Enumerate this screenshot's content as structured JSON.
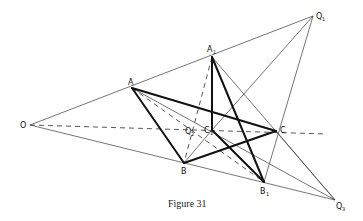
{
  "figure": {
    "caption": "Figure 31",
    "colors": {
      "background": "#ffffff",
      "ink": "#111111",
      "thin_ink": "#3a3a3a"
    },
    "points": {
      "O": {
        "label": "O",
        "sub": "",
        "x": 30,
        "y": 125
      },
      "A": {
        "label": "A",
        "sub": "",
        "x": 132,
        "y": 88
      },
      "B": {
        "label": "B",
        "sub": "",
        "x": 184,
        "y": 163
      },
      "C": {
        "label": "C",
        "sub": "",
        "x": 276,
        "y": 131
      },
      "A1": {
        "label": "A",
        "sub": "1",
        "x": 212,
        "y": 57
      },
      "B1": {
        "label": "B",
        "sub": "1",
        "x": 264,
        "y": 182
      },
      "C1": {
        "label": "C",
        "sub": "1",
        "x": 212,
        "y": 130
      },
      "Q1": {
        "label": "Q",
        "sub": "1",
        "x": 313,
        "y": 16
      },
      "Q2": {
        "label": "Q",
        "sub": "2",
        "x": 193,
        "y": 130
      },
      "Q3": {
        "label": "Q",
        "sub": "3",
        "x": 335,
        "y": 200
      }
    },
    "labels": {
      "O": "O",
      "A": "A",
      "B": "B",
      "C": "C",
      "A1": "A",
      "A1_sub": "1",
      "B1": "B",
      "B1_sub": "1",
      "C1": "C",
      "C1_sub": "1",
      "Q1": "Q",
      "Q1_sub": "1",
      "Q2": "Q",
      "Q2_sub": "2",
      "Q3": "Q",
      "Q3_sub": "3"
    },
    "segments": {
      "thick": [
        [
          "A",
          "B"
        ],
        [
          "B",
          "C"
        ],
        [
          "A",
          "C"
        ],
        [
          "A1",
          "C1"
        ],
        [
          "A1",
          "B1"
        ],
        [
          "C1",
          "B1"
        ]
      ],
      "thin": [
        [
          "O",
          "Q1"
        ],
        [
          "O",
          "Q3"
        ],
        [
          "A1",
          "Q3"
        ],
        [
          "Q1",
          "C1"
        ],
        [
          "Q1",
          "B1"
        ],
        [
          "A",
          "Q3"
        ],
        [
          "B",
          "Q1"
        ],
        [
          "C1",
          "Q3"
        ]
      ],
      "dashed": [
        [
          "O",
          "C"
        ],
        [
          "A",
          "B1"
        ],
        [
          "A1",
          "B"
        ],
        [
          "A",
          "C1"
        ]
      ]
    }
  }
}
